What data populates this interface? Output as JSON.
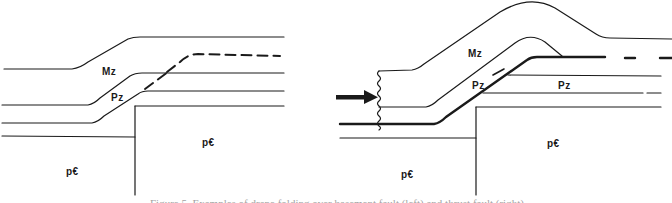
{
  "figure": {
    "caption": "Figure 5. Examples of drape folding over basement fault (left) and thrust fault (right)",
    "colors": {
      "line": "#1a1a1a",
      "background": "#ffffff"
    },
    "left_panel": {
      "name": "drape fold over basement fault block",
      "labels": {
        "mz": "Mz",
        "pz": "Pz",
        "precambrian_left": "p€",
        "precambrian_right": "p€"
      }
    },
    "right_panel": {
      "name": "thrust fault with compression arrow",
      "labels": {
        "mz": "Mz",
        "pz_hanging": "Pz",
        "pz_footwall": "Pz",
        "precambrian_left": "p€",
        "precambrian_right": "p€"
      },
      "arrow_icon": "compression-arrow"
    }
  }
}
